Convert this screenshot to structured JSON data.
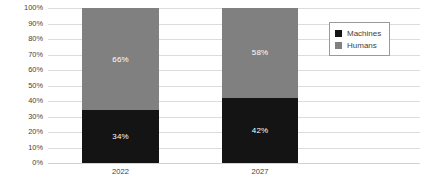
{
  "chart_data": {
    "type": "bar",
    "subtype": "stacked-column-100",
    "title": "",
    "subtitle": "",
    "xlabel": "",
    "ylabel": "",
    "categories": [
      "2022",
      "2027"
    ],
    "series": [
      {
        "name": "Machines",
        "color": "#141414",
        "values": [
          34,
          42
        ],
        "labels": [
          "34%",
          "42%"
        ]
      },
      {
        "name": "Humans",
        "color": "#808080",
        "values": [
          66,
          58
        ],
        "labels": [
          "66%",
          "58%"
        ]
      }
    ],
    "ylim": [
      0,
      100
    ],
    "ytick_values": [
      0,
      10,
      20,
      30,
      40,
      50,
      60,
      70,
      80,
      90,
      100
    ],
    "ytick_labels": [
      "0%",
      "10%",
      "20%",
      "30%",
      "40%",
      "50%",
      "60%",
      "70%",
      "80%",
      "90%",
      "100%"
    ],
    "grid": true,
    "legend_position": "top-right",
    "legend_entries": [
      {
        "label": "Machines",
        "color": "#141414"
      },
      {
        "label": "Humans",
        "color": "#808080"
      }
    ],
    "colors": {
      "machines": "#141414",
      "humans": "#808080",
      "gridline": "#dcdcdc",
      "text": "#3f3f3f",
      "background": "#ffffff",
      "legend_border": "#9a9a9a",
      "data_label": "#ffffff"
    }
  }
}
